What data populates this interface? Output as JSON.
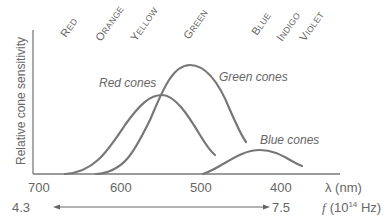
{
  "chart_data": {
    "type": "line",
    "title": "",
    "ylabel": "Relative cone sensitivity",
    "xlabel": "λ (nm)",
    "xlabel_secondary": "f (10^14 Hz)",
    "x_ticks": [
      700,
      600,
      500,
      400
    ],
    "x_range_nm": [
      700,
      330
    ],
    "secondary_axis": {
      "left": "4.3",
      "right": "7.5",
      "unit_prefix": "f",
      "unit": "(10",
      "unit_exp": "14",
      "unit_suffix": " Hz)"
    },
    "color_bands": [
      "Red",
      "Orange",
      "Yellow",
      "Green",
      "Blue",
      "Indigo",
      "Violet"
    ],
    "series": [
      {
        "name": "Red cones",
        "peak_nm": 565,
        "peak_relative": 0.55,
        "range_nm": [
          670,
          480
        ]
      },
      {
        "name": "Green cones",
        "peak_nm": 515,
        "peak_relative": 0.75,
        "range_nm": [
          630,
          440
        ]
      },
      {
        "name": "Blue cones",
        "peak_nm": 425,
        "peak_relative": 0.17,
        "range_nm": [
          495,
          370
        ]
      }
    ],
    "grid": false,
    "legend": "inline labels"
  },
  "labels": {
    "y_axis": "Relative cone sensitivity",
    "x_axis_unit": "λ (nm)",
    "ticks": [
      "700",
      "600",
      "500",
      "400"
    ],
    "freq_left": "4.3",
    "freq_right": "7.5",
    "freq_f": "f",
    "freq_unit_a": "(10",
    "freq_unit_exp": "14",
    "freq_unit_b": " Hz)",
    "colors": [
      "Red",
      "Orange",
      "Yellow",
      "Green",
      "Blue",
      "Indigo",
      "Violet"
    ],
    "red_cones": "Red cones",
    "green_cones": "Green cones",
    "blue_cones": "Blue cones"
  }
}
